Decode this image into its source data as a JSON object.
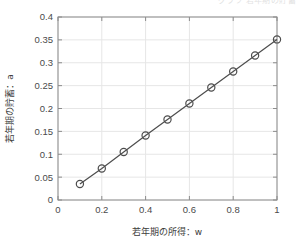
{
  "figure": {
    "background_color": "#ffffff",
    "top_clipped_text": "グラフ 若年期の貯蓄",
    "axes": {
      "box_color": "#8c8c8c",
      "grid_color": "#e6e6e6",
      "grid_on": true
    }
  },
  "chart_data": {
    "type": "line",
    "title": "",
    "subtitle": "",
    "xlabel": "若年期の所得：w",
    "ylabel": "若年期の貯蓄：a",
    "xlim": [
      0,
      1
    ],
    "ylim": [
      0,
      0.4
    ],
    "xticks": [
      0,
      0.2,
      0.4,
      0.6,
      0.8,
      1
    ],
    "xticklabels": [
      "0",
      "0.2",
      "0.4",
      "0.6",
      "0.8",
      "1"
    ],
    "yticks": [
      0,
      0.05,
      0.1,
      0.15,
      0.2,
      0.25,
      0.3,
      0.35,
      0.4
    ],
    "yticklabels": [
      "0",
      "0.05",
      "0.1",
      "0.15",
      "0.2",
      "0.25",
      "0.3",
      "0.35",
      "0.4"
    ],
    "grid": true,
    "legend": null,
    "series": [
      {
        "name": "savings",
        "marker": "circle",
        "marker_color": "#4d4d4d",
        "line_color": "#4d4d4d",
        "x": [
          0.1,
          0.2,
          0.3,
          0.4,
          0.5,
          0.6,
          0.7,
          0.8,
          0.9,
          1.0
        ],
        "values": [
          0.035,
          0.069,
          0.105,
          0.141,
          0.176,
          0.211,
          0.246,
          0.281,
          0.316,
          0.351
        ]
      }
    ]
  }
}
